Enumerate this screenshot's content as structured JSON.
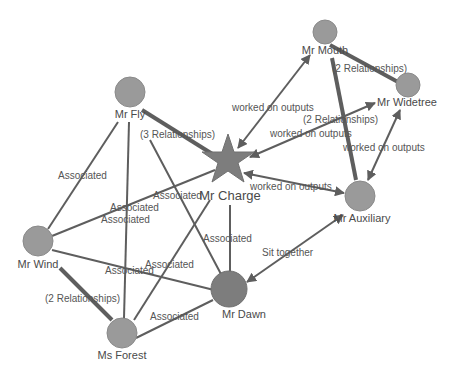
{
  "diagram": {
    "type": "network-graph",
    "nodes": [
      {
        "id": "fly",
        "label": "Mr Fly"
      },
      {
        "id": "charge",
        "label": "Mr Charge"
      },
      {
        "id": "mouth",
        "label": "Mr Mouth"
      },
      {
        "id": "widetree",
        "label": "Mr Widetree"
      },
      {
        "id": "auxiliary",
        "label": "Mr Auxiliary"
      },
      {
        "id": "wind",
        "label": "Mr Wind"
      },
      {
        "id": "dawn",
        "label": "Mr Dawn"
      },
      {
        "id": "forest",
        "label": "Ms Forest"
      }
    ],
    "edges": [
      {
        "from": "fly",
        "to": "charge",
        "label": "(3 Relationships)"
      },
      {
        "from": "fly",
        "to": "wind",
        "label": "Associated"
      },
      {
        "from": "fly",
        "to": "forest",
        "label": "Associated"
      },
      {
        "from": "fly",
        "to": "dawn",
        "label": "Associated"
      },
      {
        "from": "wind",
        "to": "charge",
        "label": "Associated"
      },
      {
        "from": "wind",
        "to": "dawn",
        "label": "Associated"
      },
      {
        "from": "wind",
        "to": "forest",
        "label": "(2 Relationships)"
      },
      {
        "from": "forest",
        "to": "charge",
        "label": "Associated"
      },
      {
        "from": "forest",
        "to": "dawn",
        "label": "Associated"
      },
      {
        "from": "charge",
        "to": "dawn",
        "label": "Associated"
      },
      {
        "from": "charge",
        "to": "mouth",
        "label": "worked on outputs"
      },
      {
        "from": "charge",
        "to": "widetree",
        "label": "worked on outputs"
      },
      {
        "from": "charge",
        "to": "auxiliary",
        "label": "worked on outputs"
      },
      {
        "from": "mouth",
        "to": "widetree",
        "label": "(2 Relationships)"
      },
      {
        "from": "mouth",
        "to": "auxiliary",
        "label": "(2 Relationships)"
      },
      {
        "from": "auxiliary",
        "to": "widetree",
        "label": "worked on outputs"
      },
      {
        "from": "dawn",
        "to": "auxiliary",
        "label": "Sit together"
      }
    ]
  }
}
